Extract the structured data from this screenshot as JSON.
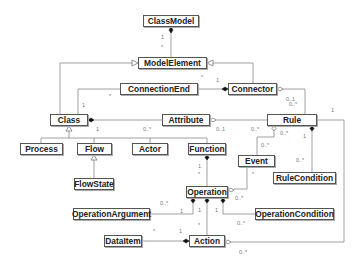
{
  "diagram": {
    "type": "UML class diagram",
    "classes": {
      "class_model": "ClassModel",
      "model_element": "ModelElement",
      "connection_end": "ConnectionEnd",
      "connector": "Connector",
      "class": "Class",
      "attribute": "Attribute",
      "rule": "Rule",
      "process": "Process",
      "flow": "Flow",
      "actor": "Actor",
      "function": "Function",
      "event": "Event",
      "rule_condition": "RuleCondition",
      "flow_state": "FlowState",
      "operation": "Operation",
      "operation_argument": "OperationArgument",
      "operation_condition": "OperationCondition",
      "data_item": "DataItem",
      "action": "Action"
    },
    "multiplicities": {
      "classmodel_modelelement_1": "1",
      "classmodel_modelelement_2": "*",
      "connend_class_star": "*",
      "connend_class_1": "1",
      "connector_connend_star": "*",
      "connector_connend_1": "1",
      "connector_rule_a": "0..1",
      "connector_rule_b": "0..*",
      "class_attr_1": "1",
      "class_attr_0n": "0..*",
      "attr_rule_01": "0..1",
      "attr_rule_0n": "0..*",
      "rule_event_0n_a": "0..*",
      "rule_event_0n_b": "0..*",
      "rule_rulecond_1": "1",
      "rule_rulecond_0n": "0..*",
      "rule_action_1": "1",
      "function_op_1": "1",
      "function_op_star": "*",
      "event_op_star": "*",
      "event_op_0n": "0..*",
      "op_arg_0n": "0..*",
      "op_arg_1": "1",
      "op_action_1": "1",
      "op_action_star": "*",
      "op_cond_1": "1",
      "op_cond_0n": "0..*",
      "dataitem_action_star": "*",
      "dataitem_action_1": "1",
      "rule_action_0n": "0..*"
    }
  }
}
